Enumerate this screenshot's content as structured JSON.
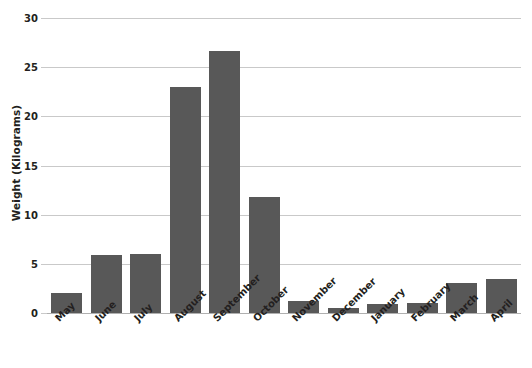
{
  "chart_data": {
    "type": "bar",
    "title": "",
    "xlabel": "",
    "ylabel": "Weight (Kilograms)",
    "ylim": [
      0,
      30
    ],
    "ytick_values": [
      0,
      5,
      10,
      15,
      20,
      25,
      30
    ],
    "ytick_labels": [
      "0",
      "5",
      "10",
      "15",
      "20",
      "25",
      "30"
    ],
    "grid": true,
    "legend": false,
    "bar_color": "#585858",
    "gridline_color": "#c9c9c9",
    "categories": [
      "May",
      "June",
      "July",
      "August",
      "September",
      "October",
      "November",
      "December",
      "January",
      "February",
      "March",
      "April"
    ],
    "values": [
      2.0,
      5.9,
      6.0,
      23.0,
      26.6,
      11.8,
      1.2,
      0.5,
      0.9,
      1.0,
      3.1,
      3.5
    ]
  }
}
